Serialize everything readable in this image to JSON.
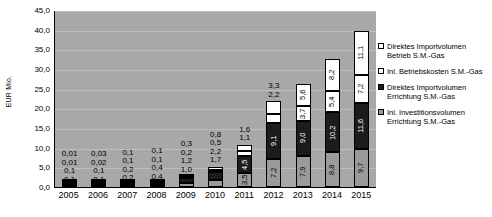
{
  "chart_data": {
    "type": "bar",
    "stacked": true,
    "title": "",
    "xlabel": "",
    "ylabel": "EUR Mio.",
    "ylim": [
      0,
      45
    ],
    "ytick_labels": [
      "45,0",
      "40,0",
      "35,0",
      "30,0",
      "25,0",
      "20,0",
      "15,0",
      "10,0",
      "5,0",
      "0,0"
    ],
    "ytick_values": [
      45,
      40,
      35,
      30,
      25,
      20,
      15,
      10,
      5,
      0
    ],
    "grid": true,
    "legend_position": "right",
    "categories": [
      "2005",
      "2006",
      "2007",
      "2008",
      "2009",
      "2010",
      "2011",
      "2012",
      "2013",
      "2014",
      "2015"
    ],
    "series": [
      {
        "name": "Inl. Investitionsvolumen Errichtung S.M.-Gas",
        "color": "#9a9a9a",
        "values": [
          0.1,
          0.1,
          0.2,
          0.4,
          1.0,
          1.7,
          3.5,
          7.2,
          7.9,
          8.8,
          9.7
        ],
        "labels": [
          "0,1",
          "0,1",
          "0,2",
          "0,4",
          "1,0",
          "1,7",
          "3,5",
          "7,2",
          "7,9",
          "8,8",
          "9,7"
        ]
      },
      {
        "name": "Direktes Importvolumen Errichtung S.M.-Gas",
        "color": "#1c1c1c",
        "values": [
          0.1,
          0.1,
          0.2,
          0.4,
          1.2,
          2.2,
          4.5,
          9.1,
          9.0,
          10.2,
          11.6
        ],
        "labels": [
          "0,1",
          "0,1",
          "0,2",
          "0,4",
          "1,2",
          "2,2",
          "4,5",
          "9,1",
          "9,0",
          "10,2",
          "11,6"
        ]
      },
      {
        "name": "Inl. Betriebskosten S.M.-Gas",
        "color": "#ffffff",
        "values": [
          0.01,
          0.02,
          0.1,
          0.1,
          0.2,
          0.5,
          1.1,
          2.2,
          3.7,
          5.4,
          7.2
        ],
        "labels": [
          "0,01",
          "0,02",
          "0,1",
          "0,1",
          "0,2",
          "0,5",
          "1,1",
          "2,2",
          "3,7",
          "5,4",
          "7,2"
        ]
      },
      {
        "name": "Direktes Importvolumen Betrieb S.M.-Gas",
        "color": "#ffffff",
        "values": [
          0.01,
          0.03,
          0.1,
          0.1,
          0.3,
          0.8,
          1.6,
          3.3,
          5.6,
          8.2,
          11.1
        ],
        "labels": [
          "0,01",
          "0,03",
          "0,1",
          "0,1",
          "0,3",
          "0,8",
          "1,6",
          "3,3",
          "5,6",
          "8,2",
          "11,1"
        ]
      }
    ],
    "legend_entries": [
      "Direktes Importvolumen Betrieb S.M.-Gas",
      "Inl. Betriebskosten S.M.-Gas",
      "Direktes Importvolumen Errichtung S.M.-Gas",
      "Inl. Investitionsvolumen Errichtung S.M.-Gas"
    ]
  }
}
